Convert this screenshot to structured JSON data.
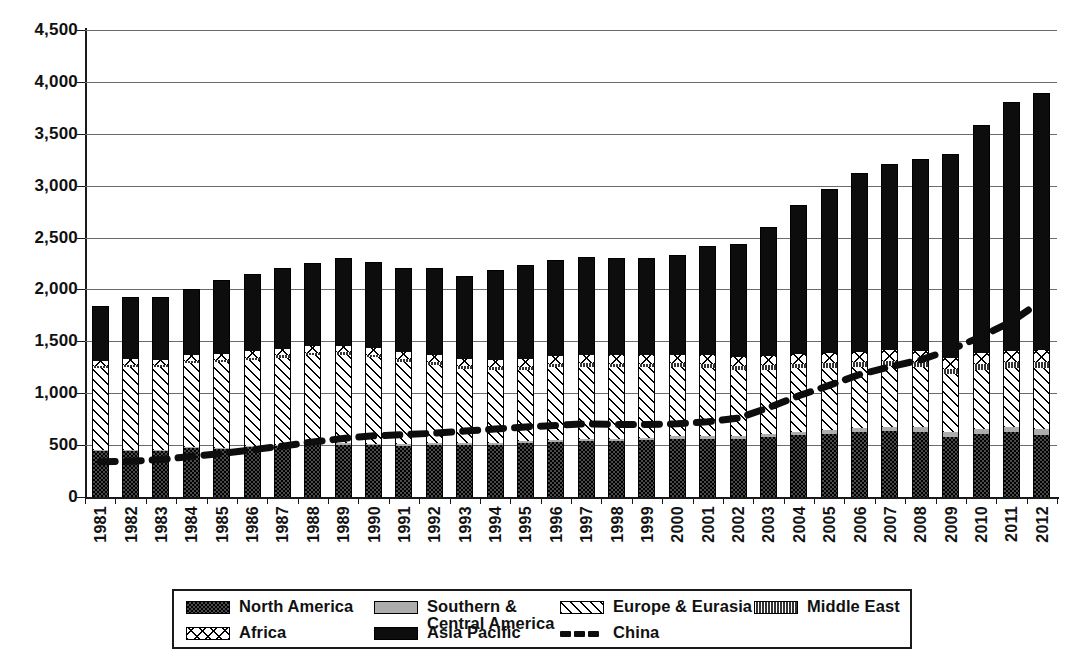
{
  "chart_data": {
    "type": "bar",
    "stacked": true,
    "title": "",
    "xlabel": "",
    "ylabel": "",
    "ylim": [
      0,
      4500
    ],
    "ytick_step": 500,
    "grid": true,
    "legend_position": "bottom",
    "ytick_labels": [
      "4,500",
      "4,000",
      "3,500",
      "3,000",
      "2,500",
      "2,000",
      "1,500",
      "1,000",
      "500",
      "0"
    ],
    "categories": [
      "1981",
      "1982",
      "1983",
      "1984",
      "1985",
      "1986",
      "1987",
      "1988",
      "1989",
      "1990",
      "1991",
      "1992",
      "1993",
      "1994",
      "1995",
      "1996",
      "1997",
      "1998",
      "1999",
      "2000",
      "2001",
      "2002",
      "2003",
      "2004",
      "2005",
      "2006",
      "2007",
      "2008",
      "2009",
      "2010",
      "2011",
      "2012"
    ],
    "series": [
      {
        "name": "North America",
        "key": "north_america",
        "fill": "dark-dotted",
        "values": [
          440,
          445,
          440,
          470,
          465,
          480,
          490,
          500,
          505,
          500,
          495,
          500,
          500,
          505,
          520,
          530,
          535,
          540,
          550,
          560,
          560,
          560,
          580,
          600,
          610,
          625,
          635,
          625,
          580,
          610,
          625,
          600
        ]
      },
      {
        "name": "Southern & Central America",
        "key": "southern_central_america",
        "fill": "light-gray",
        "values": [
          10,
          10,
          10,
          12,
          12,
          12,
          14,
          14,
          15,
          15,
          15,
          16,
          16,
          18,
          18,
          20,
          22,
          22,
          22,
          24,
          24,
          26,
          28,
          30,
          34,
          38,
          42,
          45,
          45,
          48,
          50,
          52
        ]
      },
      {
        "name": "Europe & Eurasia",
        "key": "europe_eurasia",
        "fill": "diagonal-hatch",
        "values": [
          790,
          800,
          800,
          810,
          820,
          830,
          840,
          850,
          850,
          830,
          790,
          760,
          720,
          700,
          690,
          700,
          700,
          690,
          680,
          670,
          660,
          640,
          620,
          610,
          600,
          590,
          590,
          580,
          560,
          570,
          570,
          590
        ]
      },
      {
        "name": "Middle East",
        "key": "middle_east",
        "fill": "dark-vertical-stripes",
        "values": [
          18,
          18,
          18,
          20,
          20,
          22,
          22,
          24,
          24,
          24,
          26,
          26,
          26,
          28,
          28,
          30,
          32,
          32,
          34,
          34,
          36,
          38,
          40,
          42,
          44,
          46,
          48,
          50,
          50,
          52,
          54,
          56
        ]
      },
      {
        "name": "Africa",
        "key": "africa",
        "fill": "cross-hatch",
        "values": [
          52,
          55,
          55,
          58,
          60,
          62,
          64,
          66,
          66,
          66,
          68,
          68,
          70,
          72,
          74,
          76,
          78,
          80,
          82,
          84,
          86,
          90,
          92,
          96,
          98,
          102,
          104,
          106,
          104,
          108,
          112,
          116
        ]
      },
      {
        "name": "Asia Pacific",
        "key": "asia_pacific",
        "fill": "solid-black",
        "values": [
          535,
          595,
          600,
          630,
          715,
          745,
          780,
          800,
          845,
          825,
          810,
          840,
          800,
          865,
          905,
          925,
          945,
          935,
          940,
          960,
          1050,
          1085,
          1240,
          1440,
          1585,
          1720,
          1790,
          1850,
          1965,
          2195,
          2395,
          2480
        ]
      }
    ],
    "totals": [
      1845,
      1923,
      1923,
      2000,
      2092,
      2151,
      2210,
      2254,
      2305,
      2260,
      2204,
      2210,
      2132,
      2188,
      2234,
      2281,
      2312,
      2279,
      2308,
      2332,
      2416,
      2439,
      2600,
      2818,
      2976,
      3121,
      3209,
      3256,
      3304,
      3583,
      3806,
      3894
    ],
    "line_series": {
      "name": "China",
      "key": "china",
      "style": "thick-dashed",
      "color": "#0d0d0d",
      "values": [
        340,
        345,
        360,
        390,
        420,
        455,
        490,
        530,
        565,
        590,
        600,
        615,
        635,
        655,
        675,
        690,
        705,
        700,
        700,
        705,
        725,
        760,
        860,
        975,
        1075,
        1180,
        1255,
        1320,
        1420,
        1545,
        1690,
        1890
      ]
    },
    "legend": [
      {
        "label": "North America",
        "swatch": "dark-dotted"
      },
      {
        "label": "Southern &\nCentral America",
        "swatch": "light-gray"
      },
      {
        "label": "Europe & Eurasia",
        "swatch": "diagonal-hatch"
      },
      {
        "label": "Middle East",
        "swatch": "dark-vertical-stripes"
      },
      {
        "label": "Africa",
        "swatch": "cross-hatch"
      },
      {
        "label": "Asia Pacific",
        "swatch": "solid-black"
      },
      {
        "label": "China",
        "swatch": "thick-dashed-line"
      }
    ]
  },
  "legend_labels": {
    "north_america": "North America",
    "southern_central_america_l1": "Southern &",
    "southern_central_america_l2": "Central America",
    "europe_eurasia": "Europe & Eurasia",
    "middle_east": "Middle East",
    "africa": "Africa",
    "asia_pacific": "Asia Pacific",
    "china": "China"
  }
}
